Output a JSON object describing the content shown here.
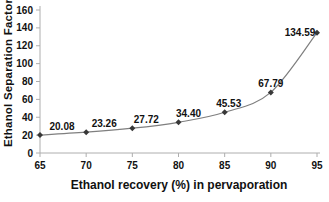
{
  "figure": {
    "background": "#ffffff"
  },
  "chart_data": {
    "type": "line",
    "title": "",
    "xlabel": "Ethanol recovery (%) in pervaporation",
    "ylabel": "Ethanol Separation Factor",
    "x": [
      65,
      70,
      75,
      80,
      85,
      90,
      95
    ],
    "series": [
      {
        "name": "Ethanol separation factor",
        "values": [
          20.08,
          23.26,
          27.72,
          34.4,
          45.53,
          67.79,
          134.59
        ]
      }
    ],
    "data_labels": [
      "20.08",
      "23.26",
      "27.72",
      "34.40",
      "45.53",
      "67.79",
      "134.59"
    ],
    "xlim": [
      65,
      95
    ],
    "ylim": [
      0,
      160
    ],
    "x_ticks": [
      "65",
      "70",
      "75",
      "80",
      "85",
      "90",
      "95"
    ],
    "y_ticks": [
      "0",
      "20",
      "40",
      "60",
      "80",
      "100",
      "120",
      "140",
      "160"
    ],
    "grid": false,
    "legend": "none",
    "line_style": "smooth",
    "marker": "diamond",
    "colors": {
      "line": "#7f7f7f",
      "marker": "#383838",
      "axis": "#aeaeae",
      "text": "#111111"
    }
  }
}
